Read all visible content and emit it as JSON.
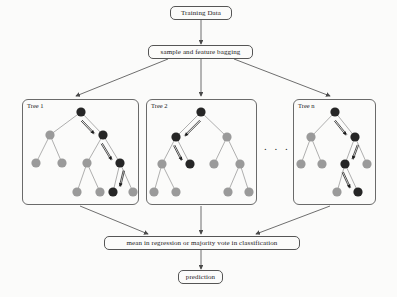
{
  "diagram": {
    "title_flow": "Random Forest training and prediction flow",
    "top": {
      "training_data": "Training Data",
      "bagging": "sample and feature bagging"
    },
    "bottom": {
      "aggregate": "mean in regression or majority vote in classification",
      "prediction": "prediction"
    },
    "ellipsis": ". . .",
    "trees": [
      {
        "label": "Tree 1"
      },
      {
        "label": "Tree 2"
      },
      {
        "label": "Tree n"
      }
    ],
    "colors": {
      "node_dark": "#262626",
      "node_gray": "#9a9a9a",
      "edge": "#9a9a9a",
      "box_border": "#5a5a5a",
      "arrow": "#1a1a1a",
      "background": "#fbfbfa",
      "connector": "#4a4a4a"
    }
  },
  "chart_data": {
    "type": "diagram",
    "nodes": [
      {
        "id": "training-data",
        "label": "Training Data",
        "shape": "rounded-rect"
      },
      {
        "id": "bagging",
        "label": "sample and feature bagging",
        "shape": "rounded-rect"
      },
      {
        "id": "tree-1",
        "label": "Tree 1",
        "shape": "panel"
      },
      {
        "id": "tree-2",
        "label": "Tree 2",
        "shape": "panel"
      },
      {
        "id": "tree-n",
        "label": "Tree n",
        "shape": "panel"
      },
      {
        "id": "aggregate",
        "label": "mean in regression or majority vote in classification",
        "shape": "rounded-rect"
      },
      {
        "id": "prediction",
        "label": "prediction",
        "shape": "rounded-rect"
      }
    ],
    "edges": [
      {
        "from": "training-data",
        "to": "bagging"
      },
      {
        "from": "bagging",
        "to": "tree-1"
      },
      {
        "from": "bagging",
        "to": "tree-2"
      },
      {
        "from": "bagging",
        "to": "tree-n"
      },
      {
        "from": "tree-1",
        "to": "aggregate"
      },
      {
        "from": "tree-2",
        "to": "aggregate"
      },
      {
        "from": "tree-n",
        "to": "aggregate"
      },
      {
        "from": "aggregate",
        "to": "prediction"
      }
    ],
    "trees": [
      {
        "name": "Tree 1",
        "nodes": [
          {
            "id": "r",
            "x": 81,
            "y": 112,
            "color": "dark"
          },
          {
            "id": "l1",
            "x": 50,
            "y": 135,
            "color": "gray"
          },
          {
            "id": "r1",
            "x": 103,
            "y": 135,
            "color": "dark"
          },
          {
            "id": "l2a",
            "x": 36,
            "y": 163,
            "color": "gray"
          },
          {
            "id": "l2b",
            "x": 62,
            "y": 163,
            "color": "gray"
          },
          {
            "id": "r2a",
            "x": 87,
            "y": 163,
            "color": "gray"
          },
          {
            "id": "r2b",
            "x": 120,
            "y": 163,
            "color": "dark"
          },
          {
            "id": "l3a",
            "x": 77,
            "y": 192,
            "color": "gray"
          },
          {
            "id": "l3b",
            "x": 100,
            "y": 192,
            "color": "gray"
          },
          {
            "id": "r3a",
            "x": 113,
            "y": 192,
            "color": "dark"
          },
          {
            "id": "r3b",
            "x": 133,
            "y": 192,
            "color": "gray"
          }
        ],
        "path": [
          "r",
          "r1",
          "r2b",
          "r3a"
        ]
      },
      {
        "name": "Tree 2",
        "nodes": [
          {
            "id": "r",
            "x": 201,
            "y": 112,
            "color": "dark"
          },
          {
            "id": "l1",
            "x": 176,
            "y": 137,
            "color": "dark"
          },
          {
            "id": "r1",
            "x": 227,
            "y": 137,
            "color": "gray"
          },
          {
            "id": "l2a",
            "x": 162,
            "y": 164,
            "color": "gray"
          },
          {
            "id": "l2b",
            "x": 190,
            "y": 164,
            "color": "dark"
          },
          {
            "id": "r2a",
            "x": 214,
            "y": 164,
            "color": "gray"
          },
          {
            "id": "r2b",
            "x": 240,
            "y": 164,
            "color": "gray"
          },
          {
            "id": "l3a",
            "x": 154,
            "y": 192,
            "color": "gray"
          },
          {
            "id": "l3b",
            "x": 176,
            "y": 192,
            "color": "gray"
          },
          {
            "id": "r3a",
            "x": 228,
            "y": 192,
            "color": "gray"
          },
          {
            "id": "r3b",
            "x": 249,
            "y": 192,
            "color": "gray"
          }
        ],
        "path": [
          "r",
          "l1",
          "l2b"
        ]
      },
      {
        "name": "Tree n",
        "nodes": [
          {
            "id": "r",
            "x": 335,
            "y": 112,
            "color": "dark"
          },
          {
            "id": "l1",
            "x": 311,
            "y": 137,
            "color": "gray"
          },
          {
            "id": "r1",
            "x": 355,
            "y": 137,
            "color": "dark"
          },
          {
            "id": "l2a",
            "x": 301,
            "y": 164,
            "color": "gray"
          },
          {
            "id": "l2b",
            "x": 322,
            "y": 164,
            "color": "gray"
          },
          {
            "id": "r2a",
            "x": 345,
            "y": 164,
            "color": "dark"
          },
          {
            "id": "r2b",
            "x": 367,
            "y": 164,
            "color": "gray"
          },
          {
            "id": "r3a",
            "x": 337,
            "y": 192,
            "color": "gray"
          },
          {
            "id": "r3b",
            "x": 358,
            "y": 192,
            "color": "dark"
          }
        ],
        "path": [
          "r",
          "r1",
          "r2a",
          "r3b"
        ]
      }
    ]
  }
}
